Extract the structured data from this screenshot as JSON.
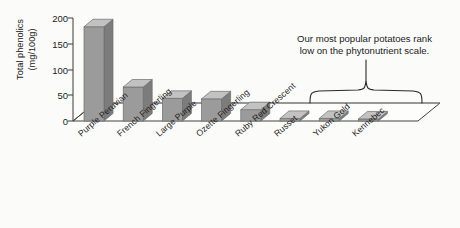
{
  "chart_data": {
    "type": "bar",
    "title": "",
    "subtitle": "",
    "xlabel": "",
    "ylabel": "Total phenolics (mg/100g)",
    "ylabel_line1": "Total phenolics",
    "ylabel_line2": "(mg/100g)",
    "ylim": [
      0,
      200
    ],
    "yticks": [
      0,
      50,
      100,
      150,
      200
    ],
    "ytick_labels": [
      "0",
      "50",
      "100",
      "150",
      "200"
    ],
    "grid": false,
    "legend": "none",
    "style": "3d-bar",
    "bar_color": "#9b9b9b",
    "bar_side_color": "#7c7c7c",
    "bar_top_color": "#c2c2c2",
    "categories": [
      "Purple Peruvian",
      "French Fingerling",
      "Large Purple",
      "Ozette Fingerling",
      "Ruby Red Crescent",
      "Russet",
      "Yukon Gold",
      "Kennebec"
    ],
    "values": [
      183,
      66,
      44,
      43,
      22,
      5,
      5,
      4
    ],
    "annotations": [
      {
        "text": "Our most popular potatoes rank low on the phytonutrient scale.",
        "line1": "Our most popular potatoes rank",
        "line2": "low on the phytonutrient scale.",
        "covers_categories": [
          "Russet",
          "Yukon Gold",
          "Kennebec"
        ],
        "marker": "curly-brace"
      }
    ]
  }
}
